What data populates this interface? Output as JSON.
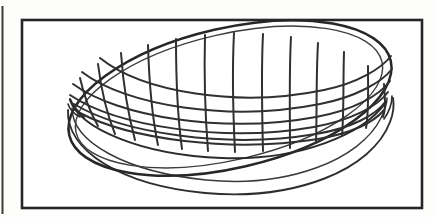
{
  "document": {
    "kind": "technical-line-drawing",
    "subject": "oval wire-mesh basket bowl in perspective",
    "style": "scanned black ink on white paper",
    "background_color": "#fdfdfc",
    "ink_color": "#2a2a2a"
  },
  "neighbor_frame": {
    "name": "adjacent-figure-edge",
    "description": "thin vertical rule cropped at the far left margin",
    "x": 2,
    "y_top": 6,
    "y_bottom": 214,
    "stroke_width": 2,
    "color": "#3a3a3a"
  },
  "frame": {
    "name": "figure-border",
    "x": 22,
    "y": 20,
    "width": 400,
    "height": 188,
    "stroke_width": 2.6,
    "color": "#262626",
    "fill": "#ffffff"
  },
  "basket": {
    "name": "wire-mesh-bowl",
    "rim": {
      "label": "outer rim ellipse",
      "center_x": 230,
      "center_y": 98,
      "radius_x": 165,
      "radius_y": 70,
      "rotation_deg": -13,
      "stroke_width": 2.4
    },
    "inner_rim": {
      "label": "inner rim ellipse",
      "center_x": 228,
      "center_y": 96,
      "radius_x": 158,
      "radius_y": 64,
      "rotation_deg": -13,
      "stroke_width": 1.6
    },
    "body": {
      "label": "outer bowl wall below rim",
      "depth": 58,
      "stroke_width": 1.8
    },
    "mesh": {
      "label": "woven wire grid",
      "vertical_wires": 13,
      "horizontal_wires": 6,
      "stroke_width": 2.0,
      "color": "#303030"
    }
  },
  "colors": {
    "ink": "#2a2a2a",
    "ink_light": "#4a4a4a",
    "paper": "#ffffff",
    "page": "#fdfdfc"
  },
  "labels": {
    "figure_title": "",
    "figure_number": ""
  }
}
